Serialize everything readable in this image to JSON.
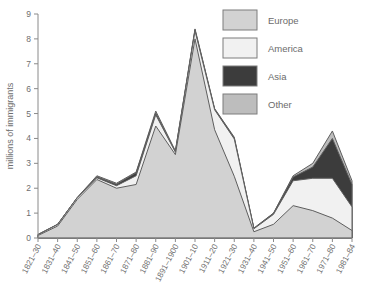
{
  "chart_data": {
    "type": "area",
    "stacked": true,
    "title": "",
    "xlabel": "",
    "ylabel": "millions of immigrants",
    "ylim": [
      0,
      9
    ],
    "yticks": [
      0,
      1,
      2,
      3,
      4,
      5,
      6,
      7,
      8,
      9
    ],
    "grid": false,
    "legend_position": "top-right",
    "categories": [
      "1821–30",
      "1831–40",
      "1841–50",
      "1851–60",
      "1861–70",
      "1871–80",
      "1881–90",
      "1891–1900",
      "1901–10",
      "1911–20",
      "1921–30",
      "1931–40",
      "1941–50",
      "1951–60",
      "1961–70",
      "1971–80",
      "1981–84"
    ],
    "series": [
      {
        "name": "Europe",
        "color": "#d2d2d2",
        "values": [
          0.1,
          0.48,
          1.55,
          2.35,
          2.0,
          2.15,
          4.5,
          3.35,
          8.0,
          4.35,
          2.48,
          0.25,
          0.55,
          1.3,
          1.1,
          0.8,
          0.3
        ]
      },
      {
        "name": "America",
        "color": "#f1f1f1",
        "values": [
          0.03,
          0.06,
          0.07,
          0.07,
          0.1,
          0.35,
          0.45,
          0.1,
          0.32,
          0.8,
          1.5,
          0.12,
          0.4,
          1.0,
          1.3,
          1.6,
          0.95
        ]
      },
      {
        "name": "Asia",
        "color": "#3c3c3c",
        "values": [
          0.0,
          0.01,
          0.0,
          0.04,
          0.06,
          0.12,
          0.07,
          0.02,
          0.05,
          0.03,
          0.04,
          0.01,
          0.04,
          0.15,
          0.45,
          1.6,
          0.9
        ]
      },
      {
        "name": "Other",
        "color": "#bdbdbd",
        "values": [
          0.02,
          0.0,
          0.01,
          0.04,
          0.04,
          0.03,
          0.08,
          0.03,
          0.03,
          0.02,
          0.03,
          0.02,
          0.01,
          0.05,
          0.15,
          0.3,
          0.15
        ]
      }
    ],
    "totals": [
      0.15,
      0.55,
      1.63,
      2.5,
      2.2,
      2.65,
      5.1,
      3.5,
      8.4,
      5.2,
      4.05,
      0.4,
      1.0,
      2.5,
      3.0,
      4.3,
      2.3
    ]
  },
  "legend": {
    "items": [
      {
        "label": "Europe"
      },
      {
        "label": "America"
      },
      {
        "label": "Asia"
      },
      {
        "label": "Other"
      }
    ]
  }
}
